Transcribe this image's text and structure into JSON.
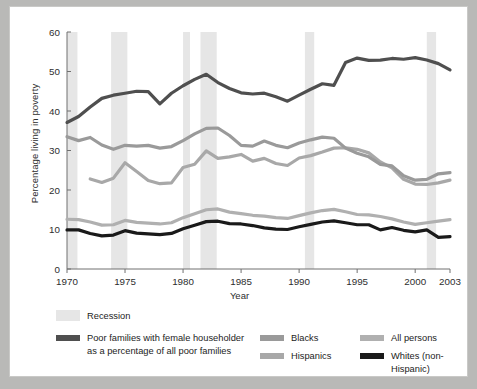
{
  "figure": {
    "background": "#ffffff",
    "page_background": "#b9b9b7"
  },
  "axes": {
    "ylabel": "Percentage living in poverty",
    "xlabel": "Year",
    "ytick_labels": [
      "0",
      "10",
      "20",
      "30",
      "40",
      "50",
      "60"
    ],
    "xtick_labels": [
      "1970",
      "1975",
      "1980",
      "1985",
      "1990",
      "1995",
      "2000",
      "2003"
    ]
  },
  "legend": {
    "recession_label": "Recession",
    "recession_color": "#e6e6e6",
    "items": [
      {
        "label": "Poor families with female householder as a percentage of all poor families",
        "color": "#4f4f4f"
      },
      {
        "label": "Blacks",
        "color": "#9a9a9a"
      },
      {
        "label": "Hispanics",
        "color": "#a8a8a8"
      },
      {
        "label": "All persons",
        "color": "#b0b0b0"
      },
      {
        "label": "Whites (non-Hispanic)",
        "color": "#1a1a1a"
      }
    ]
  },
  "chart_data": {
    "type": "line",
    "title": "",
    "xlabel": "Year",
    "ylabel": "Percentage living in poverty",
    "xlim": [
      1970,
      2003
    ],
    "ylim": [
      0,
      60
    ],
    "yticks": [
      0,
      10,
      20,
      30,
      40,
      50,
      60
    ],
    "xticks": [
      1970,
      1975,
      1980,
      1985,
      1990,
      1995,
      2000,
      2003
    ],
    "grid": false,
    "legend_position": "below",
    "recession_bands": [
      {
        "start": 1970.0,
        "end": 1970.9
      },
      {
        "start": 1973.8,
        "end": 1975.2
      },
      {
        "start": 1980.0,
        "end": 1980.6
      },
      {
        "start": 1981.5,
        "end": 1982.9
      },
      {
        "start": 1990.5,
        "end": 1991.3
      },
      {
        "start": 2001.0,
        "end": 2001.8
      }
    ],
    "series": [
      {
        "name": "Poor families with female householder as a percentage of all poor families",
        "color": "#4f4f4f",
        "width": 3.2,
        "x": [
          1970,
          1971,
          1972,
          1973,
          1974,
          1975,
          1976,
          1977,
          1978,
          1979,
          1980,
          1981,
          1982,
          1983,
          1984,
          1985,
          1986,
          1987,
          1988,
          1989,
          1990,
          1991,
          1992,
          1993,
          1994,
          1995,
          1996,
          1997,
          1998,
          1999,
          2000,
          2001,
          2002,
          2003
        ],
        "y": [
          37.1,
          38.6,
          41.0,
          43.2,
          44.0,
          44.5,
          45.0,
          44.9,
          41.8,
          44.5,
          46.4,
          48.0,
          49.3,
          47.2,
          45.7,
          44.6,
          44.3,
          44.5,
          43.6,
          42.5,
          44.0,
          45.5,
          46.9,
          46.5,
          52.3,
          53.4,
          52.8,
          52.9,
          53.3,
          53.1,
          53.5,
          52.9,
          52.0,
          50.4
        ]
      },
      {
        "name": "Blacks",
        "color": "#9a9a9a",
        "width": 3.2,
        "x": [
          1970,
          1971,
          1972,
          1973,
          1974,
          1975,
          1976,
          1977,
          1978,
          1979,
          1980,
          1981,
          1982,
          1983,
          1984,
          1985,
          1986,
          1987,
          1988,
          1989,
          1990,
          1991,
          1992,
          1993,
          1994,
          1995,
          1996,
          1997,
          1998,
          1999,
          2000,
          2001,
          2002,
          2003
        ],
        "y": [
          33.5,
          32.5,
          33.3,
          31.4,
          30.3,
          31.3,
          31.1,
          31.3,
          30.6,
          31.0,
          32.5,
          34.2,
          35.6,
          35.7,
          33.8,
          31.3,
          31.1,
          32.4,
          31.3,
          30.7,
          31.9,
          32.7,
          33.4,
          33.1,
          30.6,
          29.3,
          28.4,
          26.5,
          26.1,
          23.6,
          22.5,
          22.7,
          24.1,
          24.4
        ]
      },
      {
        "name": "Hispanics",
        "color": "#a8a8a8",
        "width": 3.2,
        "x": [
          1972,
          1973,
          1974,
          1975,
          1976,
          1977,
          1978,
          1979,
          1980,
          1981,
          1982,
          1983,
          1984,
          1985,
          1986,
          1987,
          1988,
          1989,
          1990,
          1991,
          1992,
          1993,
          1994,
          1995,
          1996,
          1997,
          1998,
          1999,
          2000,
          2001,
          2002,
          2003
        ],
        "y": [
          22.8,
          21.9,
          23.0,
          26.9,
          24.7,
          22.4,
          21.6,
          21.8,
          25.7,
          26.5,
          29.9,
          28.0,
          28.4,
          29.0,
          27.3,
          28.0,
          26.7,
          26.2,
          28.1,
          28.7,
          29.6,
          30.6,
          30.7,
          30.3,
          29.4,
          27.1,
          25.6,
          22.7,
          21.5,
          21.4,
          21.8,
          22.5
        ]
      },
      {
        "name": "All persons",
        "color": "#b0b0b0",
        "width": 3.2,
        "x": [
          1970,
          1971,
          1972,
          1973,
          1974,
          1975,
          1976,
          1977,
          1978,
          1979,
          1980,
          1981,
          1982,
          1983,
          1984,
          1985,
          1986,
          1987,
          1988,
          1989,
          1990,
          1991,
          1992,
          1993,
          1994,
          1995,
          1996,
          1997,
          1998,
          1999,
          2000,
          2001,
          2002,
          2003
        ],
        "y": [
          12.6,
          12.5,
          11.9,
          11.1,
          11.2,
          12.3,
          11.8,
          11.6,
          11.4,
          11.7,
          13.0,
          14.0,
          15.0,
          15.2,
          14.4,
          14.0,
          13.6,
          13.4,
          13.0,
          12.8,
          13.5,
          14.2,
          14.8,
          15.1,
          14.5,
          13.8,
          13.7,
          13.3,
          12.7,
          11.9,
          11.3,
          11.7,
          12.1,
          12.5
        ]
      },
      {
        "name": "Whites (non-Hispanic)",
        "color": "#1a1a1a",
        "width": 3.2,
        "x": [
          1970,
          1971,
          1972,
          1973,
          1974,
          1975,
          1976,
          1977,
          1978,
          1979,
          1980,
          1981,
          1982,
          1983,
          1984,
          1985,
          1986,
          1987,
          1988,
          1989,
          1990,
          1991,
          1992,
          1993,
          1994,
          1995,
          1996,
          1997,
          1998,
          1999,
          2000,
          2001,
          2002,
          2003
        ],
        "y": [
          9.9,
          9.9,
          9.0,
          8.4,
          8.6,
          9.7,
          9.1,
          8.9,
          8.7,
          9.0,
          10.2,
          11.1,
          12.0,
          12.1,
          11.5,
          11.4,
          11.0,
          10.4,
          10.1,
          10.0,
          10.7,
          11.3,
          11.9,
          12.2,
          11.7,
          11.2,
          11.2,
          9.9,
          10.5,
          9.8,
          9.4,
          9.9,
          8.0,
          8.2
        ]
      }
    ]
  }
}
